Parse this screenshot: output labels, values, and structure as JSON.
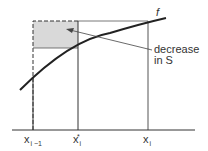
{
  "diagram": {
    "function_label": "f",
    "annotation": {
      "line1": "decrease",
      "line2": "in S"
    },
    "x_labels": [
      {
        "base": "x",
        "sub": "i −1",
        "sup": ""
      },
      {
        "base": "x",
        "sub": "i",
        "sup": "*"
      },
      {
        "base": "x",
        "sub": "i",
        "sup": ""
      }
    ],
    "colors": {
      "line": "#333333",
      "shade": "#d9d9d9",
      "text": "#333333"
    }
  }
}
